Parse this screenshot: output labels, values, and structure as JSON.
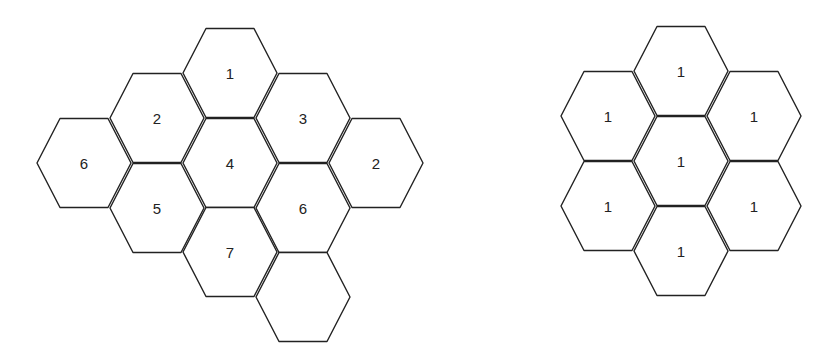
{
  "hex_geometry": {
    "half_width": 47,
    "edge_half": 24,
    "half_height": 44.5
  },
  "left_figure": {
    "name": "hex-cluster-numbered",
    "cells": [
      {
        "cx": 230,
        "cy": 73,
        "label": "1"
      },
      {
        "cx": 157,
        "cy": 118,
        "label": "2"
      },
      {
        "cx": 303,
        "cy": 118,
        "label": "3"
      },
      {
        "cx": 84,
        "cy": 163,
        "label": "6"
      },
      {
        "cx": 230,
        "cy": 163,
        "label": "4"
      },
      {
        "cx": 376,
        "cy": 163,
        "label": "2"
      },
      {
        "cx": 157,
        "cy": 208,
        "label": "5"
      },
      {
        "cx": 303,
        "cy": 208,
        "label": "6"
      },
      {
        "cx": 230,
        "cy": 252,
        "label": "7"
      },
      {
        "cx": 303,
        "cy": 297,
        "label": ""
      }
    ]
  },
  "right_figure": {
    "name": "hex-cluster-all-ones",
    "cells": [
      {
        "cx": 681,
        "cy": 71,
        "label": "1"
      },
      {
        "cx": 608,
        "cy": 116,
        "label": "1"
      },
      {
        "cx": 754,
        "cy": 116,
        "label": "1"
      },
      {
        "cx": 681,
        "cy": 161,
        "label": "1"
      },
      {
        "cx": 608,
        "cy": 206,
        "label": "1"
      },
      {
        "cx": 754,
        "cy": 206,
        "label": "1"
      },
      {
        "cx": 681,
        "cy": 251,
        "label": "1"
      }
    ]
  }
}
